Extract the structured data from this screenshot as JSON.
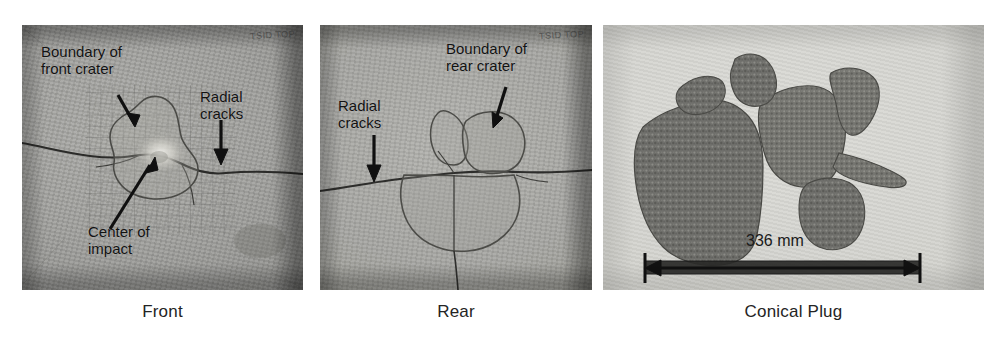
{
  "figure": {
    "background": "#ffffff",
    "panel_count": 3
  },
  "panels": [
    {
      "id": "front",
      "caption": "Front",
      "stamp": "TSID TOP",
      "annotations": [
        {
          "name": "boundary-of-front-crater",
          "text": "Boundary of\nfront crater"
        },
        {
          "name": "radial-cracks",
          "text": "Radial\ncracks"
        },
        {
          "name": "center-of-impact",
          "text": "Center of\nimpact"
        }
      ]
    },
    {
      "id": "rear",
      "caption": "Rear",
      "stamp": "TSID TOP",
      "annotations": [
        {
          "name": "boundary-of-rear-crater",
          "text": "Boundary of\nrear crater"
        },
        {
          "name": "radial-cracks",
          "text": "Radial\ncracks"
        }
      ]
    },
    {
      "id": "conical-plug",
      "caption": "Conical Plug",
      "scale_bar": {
        "label": "336 mm",
        "value": 336,
        "unit": "mm"
      },
      "fragment_count": 6
    }
  ],
  "colors": {
    "caption_text": "#242424",
    "annotation_text": "#121212",
    "plate_gray": "#9d9d9b",
    "plug_background": "#d2d2cd",
    "fragment_gray": "#6f6f6b",
    "page_background": "#ffffff"
  }
}
